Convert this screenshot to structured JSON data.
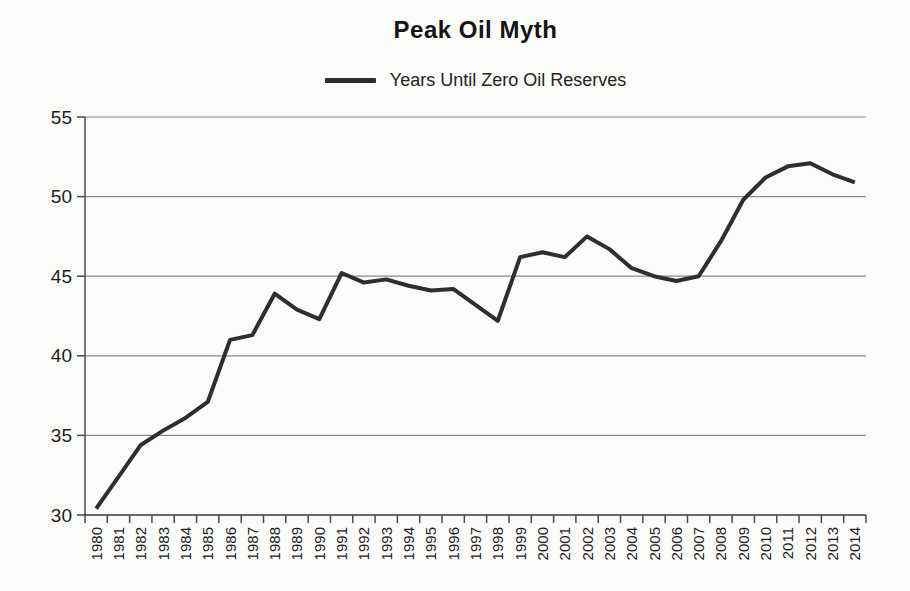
{
  "chart_data": {
    "type": "line",
    "title": "Peak Oil Myth",
    "legend_label": "Years Until Zero Oil Reserves",
    "legend_position": "top-center",
    "xlabel": "",
    "ylabel": "",
    "x": [
      1980,
      1981,
      1982,
      1983,
      1984,
      1985,
      1986,
      1987,
      1988,
      1989,
      1990,
      1991,
      1992,
      1993,
      1994,
      1995,
      1996,
      1997,
      1998,
      1999,
      2000,
      2001,
      2002,
      2003,
      2004,
      2005,
      2006,
      2007,
      2008,
      2009,
      2010,
      2011,
      2012,
      2013,
      2014
    ],
    "series": [
      {
        "name": "Years Until Zero Oil Reserves",
        "values": [
          30.4,
          32.4,
          34.4,
          35.3,
          36.1,
          37.1,
          41.0,
          41.3,
          43.9,
          42.9,
          42.3,
          45.2,
          44.6,
          44.8,
          44.4,
          44.1,
          44.2,
          43.2,
          42.2,
          46.2,
          46.5,
          46.2,
          47.5,
          46.7,
          45.5,
          45.0,
          44.7,
          45.0,
          47.2,
          49.8,
          51.2,
          51.9,
          52.1,
          51.4,
          50.9
        ]
      }
    ],
    "ylim": [
      30,
      55
    ],
    "yticks": [
      30,
      35,
      40,
      45,
      50,
      55
    ],
    "grid": true,
    "colors": {
      "line": "#2e2e2e",
      "grid": "#8a8a8a",
      "axis": "#4a4a4a",
      "tick_text": "#1d1d1d",
      "background": "#fbfbf9"
    }
  }
}
